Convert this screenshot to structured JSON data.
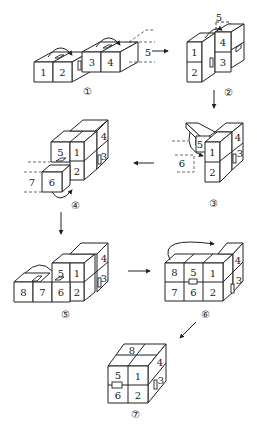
{
  "diagram": {
    "steps": [
      {
        "id": "1",
        "marker": "①",
        "faces": [
          "1",
          "2",
          "3",
          "4",
          "5"
        ]
      },
      {
        "id": "2",
        "marker": "②",
        "faces": [
          "5",
          "4",
          "1",
          "3",
          "2"
        ]
      },
      {
        "id": "3",
        "marker": "③",
        "faces": [
          "5",
          "4",
          "1",
          "3",
          "6",
          "2"
        ]
      },
      {
        "id": "4",
        "marker": "④",
        "faces": [
          "4",
          "5",
          "1",
          "3",
          "7",
          "6",
          "2"
        ]
      },
      {
        "id": "5",
        "marker": "⑤",
        "faces": [
          "4",
          "5",
          "1",
          "3",
          "8",
          "7",
          "6",
          "2"
        ]
      },
      {
        "id": "6",
        "marker": "⑥",
        "faces": [
          "8",
          "5",
          "1",
          "4",
          "3",
          "7",
          "6",
          "2"
        ]
      },
      {
        "id": "7",
        "marker": "⑦",
        "faces": [
          "8",
          "4",
          "5",
          "1",
          "3",
          "6",
          "2"
        ]
      }
    ],
    "arrows": [
      {
        "from": "1",
        "to": "2",
        "direction": "right"
      },
      {
        "from": "2",
        "to": "3",
        "direction": "down"
      },
      {
        "from": "3",
        "to": "4",
        "direction": "left"
      },
      {
        "from": "4",
        "to": "5",
        "direction": "down"
      },
      {
        "from": "5",
        "to": "6",
        "direction": "right"
      },
      {
        "from": "6",
        "to": "7",
        "direction": "down-left"
      }
    ]
  }
}
